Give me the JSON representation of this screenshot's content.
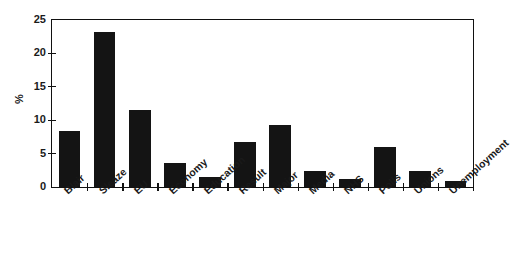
{
  "chart_data": {
    "type": "bar",
    "title": "",
    "subtitle": "",
    "xlabel": "",
    "ylabel": "%",
    "ylim": [
      0,
      25
    ],
    "yticks": [
      0,
      5,
      10,
      15,
      20,
      25
    ],
    "ytick_labels": [
      "0",
      "5",
      "10",
      "15",
      "20",
      "25"
    ],
    "grid": false,
    "legend": null,
    "bar_color": "#141414",
    "axis_color": "#111111",
    "background_color": "#ffffff",
    "categories": [
      "Blair",
      "Sleaze",
      "EU",
      "Economy",
      "Education",
      "Result",
      "Major",
      "Media",
      "NHS",
      "Polls",
      "Unions",
      "Unemployment"
    ],
    "values": [
      8.4,
      23.2,
      11.6,
      3.6,
      1.5,
      6.7,
      9.3,
      2.4,
      1.2,
      6.0,
      2.4,
      0.9
    ]
  }
}
